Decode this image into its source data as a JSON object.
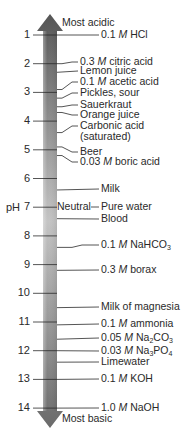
{
  "axis": {
    "label": "pH",
    "top_label": "Most acidic",
    "bottom_label": "Most basic",
    "neutral_label": "Neutral",
    "ticks": [
      "1",
      "2",
      "3",
      "4",
      "5",
      "6",
      "7",
      "8",
      "9",
      "10",
      "11",
      "12",
      "13",
      "14"
    ]
  },
  "colors": {
    "bar_top": "#555555",
    "bar_mid": "#c4c4c4",
    "bar_bottom": "#6a6a6a",
    "line": "#2a2a2a"
  },
  "substances": [
    {
      "ph": 1.0,
      "label_y": 35,
      "parts": [
        {
          "t": "0.1 "
        },
        {
          "t": "M",
          "i": true
        },
        {
          "t": " HCl"
        }
      ]
    },
    {
      "ph": 2.0,
      "label_y": 62,
      "parts": [
        {
          "t": "0.3 "
        },
        {
          "t": "M",
          "i": true
        },
        {
          "t": " citric acid"
        }
      ]
    },
    {
      "ph": 2.3,
      "label_y": 71,
      "parts": [
        {
          "t": "Lemon juice"
        }
      ]
    },
    {
      "ph": 2.9,
      "label_y": 82,
      "parts": [
        {
          "t": "0.1 "
        },
        {
          "t": "M",
          "i": true
        },
        {
          "t": " acetic acid"
        }
      ]
    },
    {
      "ph": 3.2,
      "label_y": 93,
      "parts": [
        {
          "t": "Pickles, sour"
        }
      ]
    },
    {
      "ph": 3.5,
      "label_y": 105,
      "parts": [
        {
          "t": "Sauerkraut"
        }
      ]
    },
    {
      "ph": 3.7,
      "label_y": 115,
      "parts": [
        {
          "t": "Orange juice"
        }
      ]
    },
    {
      "ph": 4.4,
      "label_y": 126,
      "parts": [
        {
          "t": "Carbonic acid"
        }
      ],
      "second_line": "(saturated)"
    },
    {
      "ph": 4.9,
      "label_y": 152,
      "parts": [
        {
          "t": "Beer"
        }
      ]
    },
    {
      "ph": 5.2,
      "label_y": 162,
      "parts": [
        {
          "t": "0.03 "
        },
        {
          "t": "M",
          "i": true
        },
        {
          "t": " boric acid"
        }
      ]
    },
    {
      "ph": 6.4,
      "label_y": 189,
      "parts": [
        {
          "t": "Milk"
        }
      ]
    },
    {
      "ph": 7.0,
      "label_y": 207,
      "parts": [
        {
          "t": "Pure water"
        }
      ],
      "neutral": true
    },
    {
      "ph": 7.4,
      "label_y": 219,
      "parts": [
        {
          "t": "Blood"
        }
      ]
    },
    {
      "ph": 8.4,
      "label_y": 245,
      "parts": [
        {
          "t": "0.1 "
        },
        {
          "t": "M",
          "i": true
        },
        {
          "t": " NaHCO"
        },
        {
          "t": "3",
          "s": true
        }
      ]
    },
    {
      "ph": 9.2,
      "label_y": 270,
      "parts": [
        {
          "t": "0.3 "
        },
        {
          "t": "M",
          "i": true
        },
        {
          "t": " borax"
        }
      ]
    },
    {
      "ph": 10.5,
      "label_y": 307,
      "parts": [
        {
          "t": "Milk of magnesia"
        }
      ]
    },
    {
      "ph": 11.1,
      "label_y": 324,
      "parts": [
        {
          "t": "0.1 "
        },
        {
          "t": "M",
          "i": true
        },
        {
          "t": " ammonia"
        }
      ]
    },
    {
      "ph": 11.6,
      "label_y": 338,
      "parts": [
        {
          "t": "0.05 "
        },
        {
          "t": "M",
          "i": true
        },
        {
          "t": " Na"
        },
        {
          "t": "2",
          "s": true
        },
        {
          "t": "CO"
        },
        {
          "t": "3",
          "s": true
        }
      ]
    },
    {
      "ph": 12.0,
      "label_y": 351,
      "parts": [
        {
          "t": "0.03 "
        },
        {
          "t": "M",
          "i": true
        },
        {
          "t": " Na"
        },
        {
          "t": "3",
          "s": true
        },
        {
          "t": "PO"
        },
        {
          "t": "4",
          "s": true
        }
      ]
    },
    {
      "ph": 12.4,
      "label_y": 362,
      "parts": [
        {
          "t": "Limewater"
        }
      ]
    },
    {
      "ph": 13.0,
      "label_y": 379,
      "parts": [
        {
          "t": "0.1 "
        },
        {
          "t": "M",
          "i": true
        },
        {
          "t": " KOH"
        }
      ]
    },
    {
      "ph": 14.0,
      "label_y": 408,
      "parts": [
        {
          "t": "1.0 "
        },
        {
          "t": "M",
          "i": true
        },
        {
          "t": " NaOH"
        }
      ]
    }
  ]
}
